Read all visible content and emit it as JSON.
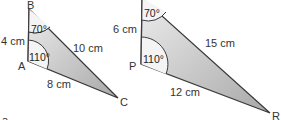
{
  "diagram": {
    "colors": {
      "fill": "#bdbdbd",
      "fill_light": "#e6e6e6",
      "stroke": "#3a3a3a",
      "text": "#333333"
    },
    "triangle_left": {
      "vertices": {
        "top": "B",
        "left": "A",
        "right": "C"
      },
      "sides": {
        "BA": "4 cm",
        "BC": "10 cm",
        "AC": "8 cm"
      },
      "angles": {
        "B": "70°",
        "A": "110°"
      }
    },
    "triangle_right": {
      "vertices": {
        "left": "P",
        "right": "R"
      },
      "sides": {
        "QP": "6 cm",
        "QR": "15 cm",
        "PR": "12 cm"
      },
      "angles": {
        "Q": "70°",
        "P": "110°"
      }
    },
    "footer_fragment": "a"
  }
}
